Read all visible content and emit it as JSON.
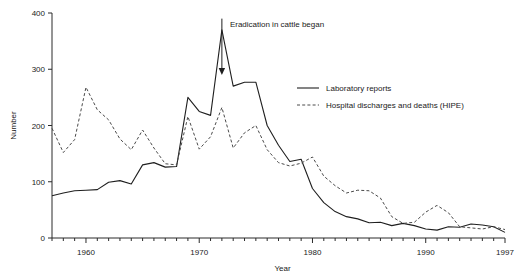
{
  "chart_data": {
    "type": "line",
    "title": "",
    "xlabel": "Year",
    "ylabel": "Number",
    "xlim": [
      1957,
      1997
    ],
    "ylim": [
      0,
      400
    ],
    "grid": false,
    "legend_position": "center-right",
    "x_tick_labels": [
      "1960",
      "1970",
      "1980",
      "1990",
      "1997"
    ],
    "x_tick_values": [
      1960,
      1970,
      1980,
      1990,
      1997
    ],
    "y_tick_labels": [
      "0",
      "100",
      "200",
      "300",
      "400"
    ],
    "y_tick_values": [
      0,
      100,
      200,
      300,
      400
    ],
    "x_minor_tick_interval": 1,
    "annotations": [
      {
        "text": "Eradication in cattle began",
        "arrow_x": 1972,
        "arrow_y_top": 390,
        "arrow_y_tip": 290
      }
    ],
    "x": [
      1957,
      1958,
      1959,
      1960,
      1961,
      1962,
      1963,
      1964,
      1965,
      1966,
      1967,
      1968,
      1969,
      1970,
      1971,
      1972,
      1973,
      1974,
      1975,
      1976,
      1977,
      1978,
      1979,
      1980,
      1981,
      1982,
      1983,
      1984,
      1985,
      1986,
      1987,
      1988,
      1989,
      1990,
      1991,
      1992,
      1993,
      1994,
      1995,
      1996,
      1997
    ],
    "series": [
      {
        "name": "Laboratory reports",
        "style": "solid",
        "color": "#1f1f1f",
        "values": [
          75,
          80,
          84,
          85,
          86,
          99,
          102,
          96,
          130,
          134,
          126,
          127,
          250,
          225,
          218,
          370,
          270,
          277,
          277,
          200,
          165,
          136,
          140,
          88,
          63,
          47,
          38,
          34,
          27,
          28,
          22,
          26,
          22,
          16,
          14,
          20,
          19,
          25,
          23,
          20,
          10
        ]
      },
      {
        "name": "Hospital discharges and deaths (HIPE)",
        "style": "dashed",
        "color": "#4a4a4a",
        "values": [
          195,
          152,
          175,
          268,
          228,
          210,
          176,
          157,
          192,
          160,
          132,
          130,
          216,
          158,
          180,
          232,
          160,
          187,
          200,
          157,
          134,
          128,
          133,
          144,
          110,
          93,
          80,
          85,
          84,
          71,
          38,
          26,
          28,
          46,
          58,
          45,
          20,
          18,
          16,
          20,
          15
        ]
      }
    ]
  },
  "legend": {
    "items": [
      {
        "label": "Laboratory reports",
        "style": "solid"
      },
      {
        "label": "Hospital discharges and deaths (HIPE)",
        "style": "dashed"
      }
    ]
  }
}
